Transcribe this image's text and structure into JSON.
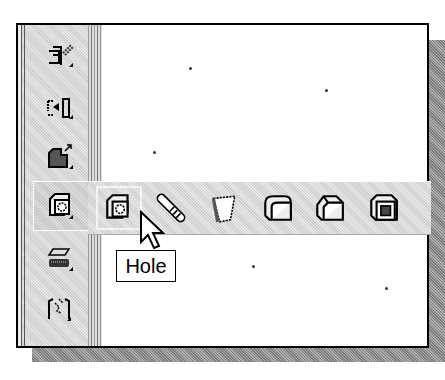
{
  "window": {
    "toolbar": {
      "items": [
        {
          "name": "sketch-insert-icon",
          "label": ""
        },
        {
          "name": "move-copy-icon",
          "label": ""
        },
        {
          "name": "feature-extrude-icon",
          "label": ""
        },
        {
          "name": "hole-icon",
          "label": "",
          "active": true
        },
        {
          "name": "shell-plane-icon",
          "label": ""
        },
        {
          "name": "pattern-icon",
          "label": ""
        }
      ]
    },
    "flyout": {
      "items": [
        {
          "name": "hole-icon",
          "label": "Hole",
          "hover": true
        },
        {
          "name": "thread-icon",
          "label": ""
        },
        {
          "name": "draft-icon",
          "label": ""
        },
        {
          "name": "fillet-icon",
          "label": ""
        },
        {
          "name": "chamfer-icon",
          "label": ""
        },
        {
          "name": "shell-icon",
          "label": ""
        }
      ]
    },
    "tooltip": {
      "text": "Hole"
    },
    "colors": {
      "background": "#ffffff",
      "toolbar": "#d8d8d8",
      "border": "#000000",
      "shadow": "#9a9a9a"
    }
  }
}
